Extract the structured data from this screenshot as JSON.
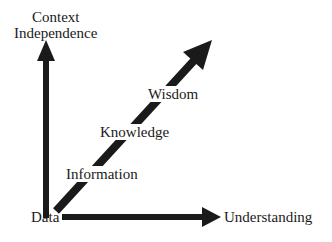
{
  "diagram": {
    "type": "DIKW hierarchy axes",
    "colors": {
      "arrow": "#1a1a1a",
      "text": "#1a1a1a",
      "background": "#ffffff"
    },
    "axes": {
      "y_axis_label_line1": "Context",
      "y_axis_label_line2": "Independence",
      "x_axis_label": "Understanding",
      "origin_label": "Data"
    },
    "levels": [
      {
        "label": "Information"
      },
      {
        "label": "Knowledge"
      },
      {
        "label": "Wisdom"
      }
    ]
  }
}
